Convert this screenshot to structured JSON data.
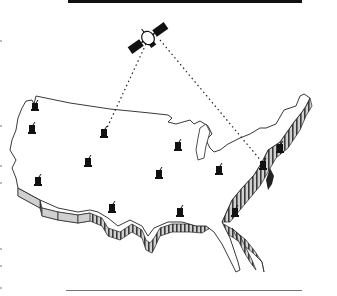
{
  "figure": {
    "colors": {
      "ink": "#111111",
      "outline": "#222222",
      "extrusion_light": "#d0d0d0",
      "extrusion_dark": "#3a3a3a",
      "rule": "#777777",
      "background": "#ffffff"
    },
    "satellite": {
      "x": 148,
      "y": 38
    },
    "beams": [
      {
        "from": "satellite",
        "to_station": 2
      },
      {
        "from": "satellite",
        "to_station": 10
      }
    ],
    "stations": [
      {
        "id": 0,
        "x": 35,
        "y": 106
      },
      {
        "id": 1,
        "x": 32,
        "y": 129
      },
      {
        "id": 2,
        "x": 104,
        "y": 133
      },
      {
        "id": 3,
        "x": 38,
        "y": 181
      },
      {
        "id": 4,
        "x": 88,
        "y": 162
      },
      {
        "id": 5,
        "x": 159,
        "y": 174
      },
      {
        "id": 6,
        "x": 112,
        "y": 208
      },
      {
        "id": 7,
        "x": 178,
        "y": 146
      },
      {
        "id": 8,
        "x": 219,
        "y": 170
      },
      {
        "id": 9,
        "x": 280,
        "y": 148
      },
      {
        "id": 10,
        "x": 263,
        "y": 165
      },
      {
        "id": 11,
        "x": 180,
        "y": 212
      },
      {
        "id": 12,
        "x": 235,
        "y": 212
      }
    ]
  }
}
